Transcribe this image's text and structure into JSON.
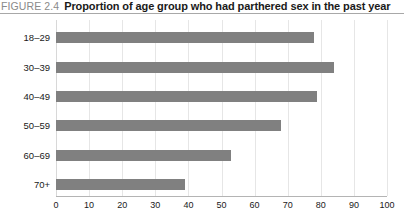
{
  "header": {
    "figure_number": "FIGURE 2.4",
    "title": "Proportion of age group who had parthered sex in the past year"
  },
  "chart_data": {
    "type": "bar",
    "orientation": "horizontal",
    "title": "Proportion of age group who had parthered sex in the past year",
    "xlabel": "",
    "ylabel": "",
    "categories": [
      "18–29",
      "30–39",
      "40–49",
      "50–59",
      "60–69",
      "70+"
    ],
    "values": [
      78,
      84,
      79,
      68,
      53,
      39
    ],
    "xlim": [
      0,
      100
    ],
    "xticks": [
      0,
      10,
      20,
      30,
      40,
      50,
      60,
      70,
      80,
      90,
      100
    ],
    "xtick_labels": [
      "0",
      "10",
      "20",
      "30",
      "40",
      "50",
      "60",
      "70",
      "80",
      "90",
      "100"
    ],
    "grid": true,
    "legend": false,
    "bar_color": "#808080",
    "background_color": "#ffffff"
  }
}
